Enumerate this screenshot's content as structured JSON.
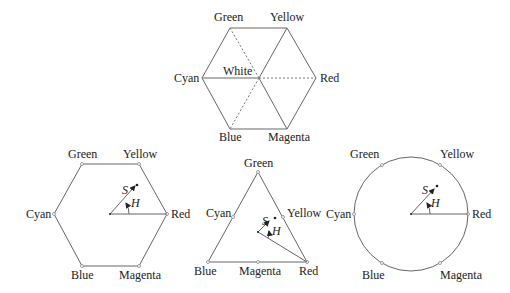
{
  "figure": {
    "top_hexcone": {
      "labels": {
        "green": "Green",
        "yellow": "Yellow",
        "red": "Red",
        "magenta": "Magenta",
        "blue": "Blue",
        "cyan": "Cyan",
        "white": "White"
      }
    },
    "hexagon": {
      "labels": {
        "green": "Green",
        "yellow": "Yellow",
        "red": "Red",
        "magenta": "Magenta",
        "blue": "Blue",
        "cyan": "Cyan",
        "s": "S",
        "h": "H"
      }
    },
    "triangle": {
      "labels": {
        "green": "Green",
        "yellow": "Yellow",
        "red": "Red",
        "magenta": "Magenta",
        "blue": "Blue",
        "cyan": "Cyan",
        "s": "S",
        "h": "H"
      }
    },
    "circle": {
      "labels": {
        "green": "Green",
        "yellow": "Yellow",
        "red": "Red",
        "magenta": "Magenta",
        "blue": "Blue",
        "cyan": "Cyan",
        "s": "S",
        "h": "H"
      }
    }
  }
}
